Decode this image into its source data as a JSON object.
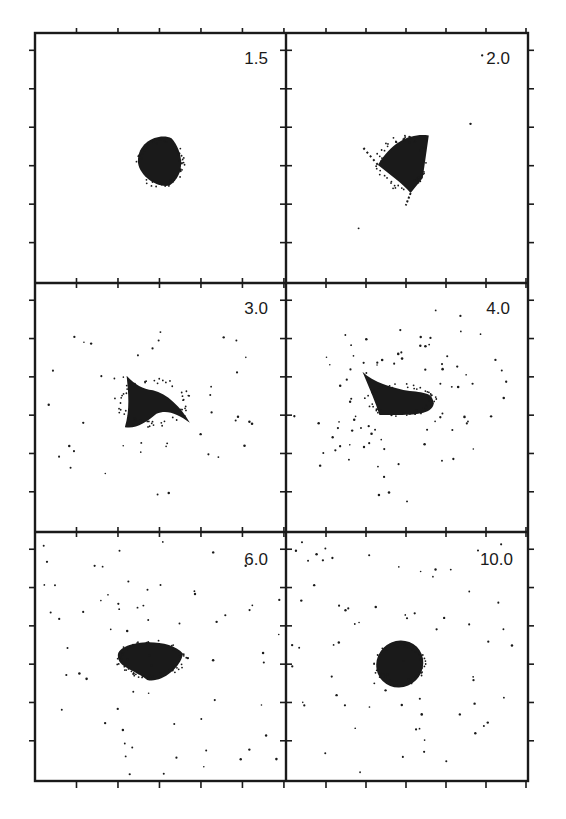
{
  "chart_data": {
    "type": "scatter",
    "title": "",
    "layout": {
      "rows": 3,
      "cols": 2,
      "grid": false,
      "legend": "none",
      "axis_tick_labels": "none",
      "ticks_per_side": 6
    },
    "panels": [
      {
        "label": "1.5",
        "row": 0,
        "col": 0,
        "description": "compact round cluster at center",
        "core": {
          "shape": "blob",
          "cx": 0.5,
          "cy": 0.52,
          "rx": 0.09,
          "ry": 0.09
        },
        "halo_points": 0
      },
      {
        "label": "2.0",
        "row": 0,
        "col": 1,
        "description": "triangular cluster with thin tails to upper-left and lower edge",
        "core": {
          "shape": "triangle",
          "cx": 0.48,
          "cy": 0.52,
          "rx": 0.1,
          "ry": 0.1
        },
        "halo_points": 4
      },
      {
        "label": "3.0",
        "row": 1,
        "col": 0,
        "description": "swept crescent with spiral arms of scattered points",
        "core": {
          "shape": "crescent",
          "cx": 0.47,
          "cy": 0.48,
          "rx": 0.14,
          "ry": 0.09
        },
        "halo_points": 40
      },
      {
        "label": "4.0",
        "row": 1,
        "col": 1,
        "description": "elongated tilted bar with widely dispersed halo",
        "core": {
          "shape": "bar",
          "cx": 0.47,
          "cy": 0.47,
          "rx": 0.14,
          "ry": 0.06
        },
        "halo_points": 85
      },
      {
        "label": "6.0",
        "row": 2,
        "col": 0,
        "description": "oblong cluster with sparse halo filling the panel",
        "core": {
          "shape": "ellipse",
          "cx": 0.46,
          "cy": 0.51,
          "rx": 0.13,
          "ry": 0.07
        },
        "halo_points": 70
      },
      {
        "label": "10.0",
        "row": 2,
        "col": 1,
        "description": "tilted ellipse cluster with sparse halo",
        "core": {
          "shape": "tilted-ellipse",
          "cx": 0.47,
          "cy": 0.53,
          "rx": 0.1,
          "ry": 0.08
        },
        "halo_points": 70
      }
    ]
  },
  "panels": {
    "p0": {
      "label": "1.5"
    },
    "p1": {
      "label": "2.0"
    },
    "p2": {
      "label": "3.0"
    },
    "p3": {
      "label": "4.0"
    },
    "p4": {
      "label": "6.0"
    },
    "p5": {
      "label": "10.0"
    }
  },
  "colors": {
    "ink": "#1a1a1a",
    "background": "#ffffff"
  }
}
